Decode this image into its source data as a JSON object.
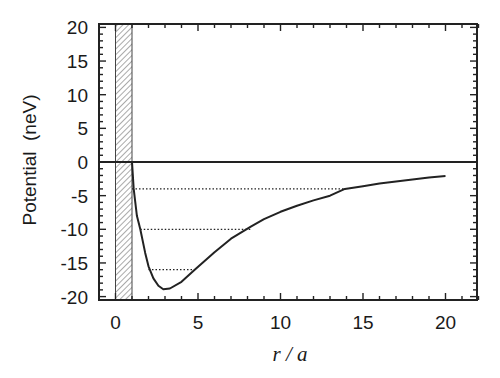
{
  "chart_data": {
    "type": "line",
    "title": "",
    "xlabel": "r / a",
    "ylabel": "Potential  (neV)",
    "xlim": [
      -1,
      22
    ],
    "ylim": [
      -21,
      20.5
    ],
    "grid": false,
    "legend": null,
    "x_ticks": [
      0,
      5,
      10,
      15,
      20
    ],
    "y_ticks": [
      20,
      15,
      10,
      5,
      0,
      -5,
      -10,
      -15,
      -20
    ],
    "x_minor_step": 1,
    "y_minor_step": 1,
    "series": [
      {
        "name": "potential",
        "style": "solid",
        "points": [
          [
            1.0,
            0
          ],
          [
            1.1,
            -4.0
          ],
          [
            1.3,
            -8.0
          ],
          [
            1.5,
            -10.0
          ],
          [
            1.8,
            -13.5
          ],
          [
            2.0,
            -15.5
          ],
          [
            2.3,
            -17.3
          ],
          [
            2.6,
            -18.4
          ],
          [
            2.9,
            -18.9
          ],
          [
            3.3,
            -18.8
          ],
          [
            4.0,
            -17.8
          ],
          [
            4.8,
            -16.0
          ],
          [
            6.0,
            -13.4
          ],
          [
            7.0,
            -11.4
          ],
          [
            8.2,
            -9.6
          ],
          [
            9.0,
            -8.5
          ],
          [
            10.0,
            -7.4
          ],
          [
            11.0,
            -6.5
          ],
          [
            12.0,
            -5.7
          ],
          [
            13.0,
            -5.0
          ],
          [
            13.9,
            -4.0
          ],
          [
            15.0,
            -3.6
          ],
          [
            16.0,
            -3.2
          ],
          [
            17.0,
            -2.9
          ],
          [
            18.0,
            -2.6
          ],
          [
            19.0,
            -2.3
          ],
          [
            20.0,
            -2.1
          ]
        ]
      }
    ],
    "zero_line": {
      "y": 0,
      "x_from": -1,
      "x_to": 22
    },
    "bound_state_levels": [
      {
        "energy": -4,
        "x_from": 1.0,
        "x_to": 13.9
      },
      {
        "energy": -10,
        "x_from": 1.5,
        "x_to": 8.2
      },
      {
        "energy": -16,
        "x_from": 2.0,
        "x_to": 4.8
      }
    ],
    "hard_core_region": {
      "x_from": 0,
      "x_to": 1,
      "fill": "hatched"
    }
  },
  "colors": {
    "line": "#222222",
    "frame": "#222222",
    "hatch": "#444444",
    "background": "#ffffff"
  }
}
